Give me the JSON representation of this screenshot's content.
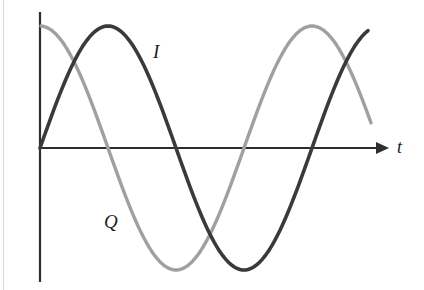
{
  "figure": {
    "title": "",
    "background_color": "#ffffff",
    "width": 424,
    "height": 290
  },
  "axes": {
    "origin_x": 40,
    "baseline_y": 148,
    "y_axis_top": 12,
    "y_axis_bottom": 282,
    "x_axis_end": 386,
    "axis_color": "#2e2e2e",
    "x_axis_label": "t",
    "y_axis_label": "",
    "has_arrow_head": true,
    "grid": false,
    "tick_labels": []
  },
  "labels": {
    "i_label": "I",
    "q_label": "Q",
    "t_label": "t"
  },
  "chart_data": {
    "type": "line",
    "title": "",
    "xlabel": "t",
    "ylabel": "",
    "grid": false,
    "legend_position": "inline-annotations",
    "xlim": [
      0,
      1.18
    ],
    "ylim": [
      -1.15,
      1.15
    ],
    "x_unit": "periods",
    "amplitude_px": 122,
    "period_px": 272,
    "series": [
      {
        "name": "I",
        "label": "I",
        "color": "#3a3a3a",
        "linewidth": 3.6,
        "waveform": "sine",
        "phase_deg": 0,
        "amplitude": 1.0,
        "description": "in-phase component, starts at zero rising",
        "key_points": [
          {
            "label": "start-zero-rising",
            "x_px": 40,
            "y_px": 148,
            "value": 0.0
          },
          {
            "label": "peak-1",
            "x_px": 107,
            "y_px": 26,
            "value": 1.0
          },
          {
            "label": "zero-falling",
            "x_px": 177,
            "y_px": 148,
            "value": 0.0
          },
          {
            "label": "trough-1",
            "x_px": 245,
            "y_px": 268,
            "value": -1.0
          },
          {
            "label": "zero-rising",
            "x_px": 315,
            "y_px": 148,
            "value": 0.0
          },
          {
            "label": "end",
            "x_px": 368,
            "y_px": 34,
            "value": 0.93
          }
        ]
      },
      {
        "name": "Q",
        "label": "Q",
        "color": "#a0a0a0",
        "linewidth": 3.4,
        "waveform": "cosine",
        "phase_deg": 90,
        "amplitude": 1.0,
        "description": "quadrature component, leads I by 90 degrees",
        "key_points": [
          {
            "label": "start-peak",
            "x_px": 41,
            "y_px": 25,
            "value": 1.0
          },
          {
            "label": "zero-falling",
            "x_px": 110,
            "y_px": 148,
            "value": 0.0
          },
          {
            "label": "trough-1",
            "x_px": 177,
            "y_px": 268,
            "value": -1.0
          },
          {
            "label": "zero-rising",
            "x_px": 245,
            "y_px": 148,
            "value": 0.0
          },
          {
            "label": "peak-2",
            "x_px": 312,
            "y_px": 25,
            "value": 1.0
          },
          {
            "label": "end",
            "x_px": 371,
            "y_px": 98,
            "value": 0.4
          }
        ]
      }
    ],
    "annotations": [
      {
        "text": "I",
        "x_px": 158,
        "y_px": 52,
        "series": "I"
      },
      {
        "text": "Q",
        "x_px": 110,
        "y_px": 222,
        "series": "Q"
      },
      {
        "text": "t",
        "x_px": 401,
        "y_px": 147,
        "series": null
      }
    ]
  }
}
